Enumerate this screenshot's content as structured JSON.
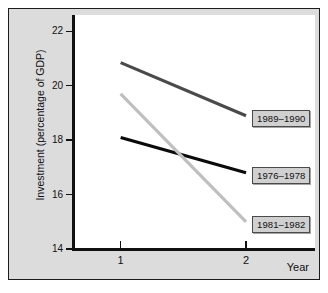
{
  "chart_data": {
    "type": "line",
    "title": "",
    "subtitle": "",
    "xlabel": "Year",
    "ylabel": "Investment (percentage of GDP)",
    "x": [
      1,
      2
    ],
    "x_tick_labels": [
      "1",
      "2"
    ],
    "xlim": [
      0.62,
      2.55
    ],
    "ylim": [
      14,
      22.6
    ],
    "y_ticks": [
      14,
      16,
      18,
      20,
      22
    ],
    "y_tick_labels": [
      "14",
      "16",
      "18",
      "20",
      "22"
    ],
    "grid": false,
    "legend_position": "inline-right-callouts",
    "series": [
      {
        "name": "1989–1990",
        "values": [
          20.85,
          18.9
        ],
        "color": "#4a4a4a"
      },
      {
        "name": "1976–1978",
        "values": [
          18.1,
          16.8
        ],
        "color": "#0a0a0a"
      },
      {
        "name": "1981–1982",
        "values": [
          19.7,
          15.0
        ],
        "color": "#bfbfbf"
      }
    ],
    "annotations": [
      {
        "text": "1989–1990",
        "series": "1989–1990"
      },
      {
        "text": "1976–1978",
        "series": "1976–1978"
      },
      {
        "text": "1981–1982",
        "series": "1981–1982"
      }
    ]
  },
  "figure": {
    "background_color": "#ffffff",
    "panel_color": "#dcdcdc",
    "plot_color": "#ffffff",
    "border_color": "#1c1c1c",
    "axis_color": "#111111"
  }
}
